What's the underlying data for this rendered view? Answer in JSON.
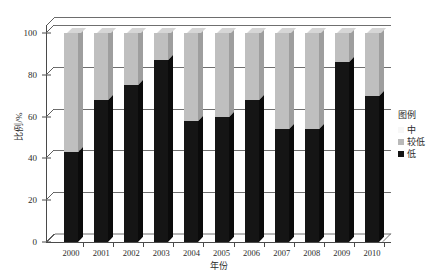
{
  "chart_data": {
    "type": "bar",
    "subtype": "stacked-column-3d",
    "title": "",
    "xlabel": "年份",
    "ylabel": "比例/%",
    "ylim": [
      0,
      100
    ],
    "yticks": [
      0,
      20,
      40,
      60,
      80,
      100
    ],
    "ytick_labels": [
      "0",
      "20",
      "40",
      "60",
      "80",
      "100"
    ],
    "grid": true,
    "grid_axis": "y",
    "legend_position": "right",
    "legend_title": "图例",
    "categories": [
      "2000",
      "2001",
      "2002",
      "2003",
      "2004",
      "2005",
      "2006",
      "2007",
      "2008",
      "2009",
      "2010"
    ],
    "series": [
      {
        "name": "低",
        "color": "#151515",
        "values": [
          43,
          68,
          75,
          87,
          58,
          60,
          68,
          54,
          54,
          86,
          70
        ]
      },
      {
        "name": "较低",
        "color": "#bfbfbf",
        "values": [
          57,
          32,
          25,
          13,
          42,
          40,
          32,
          46,
          46,
          14,
          30
        ]
      },
      {
        "name": "中",
        "color": "#fbfbfb",
        "values": [
          0,
          0,
          0,
          0,
          0,
          0,
          0,
          0,
          0,
          0,
          0
        ]
      }
    ]
  },
  "axes": {
    "y_title": "比例/%",
    "x_title": "年份"
  },
  "legend": {
    "title": "图例",
    "items": [
      {
        "label": "中",
        "swatch": "mid"
      },
      {
        "label": "较低",
        "swatch": "lower"
      },
      {
        "label": "低",
        "swatch": "low"
      }
    ]
  },
  "colors": {
    "low": "#151515",
    "lower": "#bfbfbf",
    "mid": "#fbfbfb",
    "axis": "#4a4a4a",
    "grid": "#6f6f6f"
  }
}
